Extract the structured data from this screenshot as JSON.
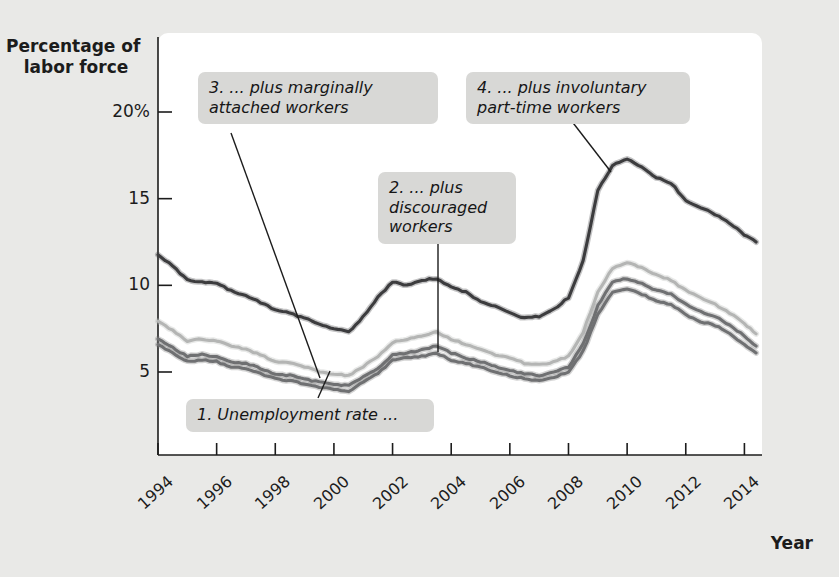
{
  "figure": {
    "background_color": "#e9e9e7",
    "plot_background_color": "#ffffff"
  },
  "axes": {
    "y_title_line1": "Percentage of",
    "y_title_line2": "labor force",
    "x_title": "Year",
    "y_ticks": [
      {
        "value": 20,
        "label": "20%"
      },
      {
        "value": 15,
        "label": "15"
      },
      {
        "value": 10,
        "label": "10"
      },
      {
        "value": 5,
        "label": "5"
      }
    ],
    "x_ticks": [
      {
        "value": 1994,
        "label": "1994"
      },
      {
        "value": 1996,
        "label": "1996"
      },
      {
        "value": 1998,
        "label": "1998"
      },
      {
        "value": 2000,
        "label": "2000"
      },
      {
        "value": 2002,
        "label": "2002"
      },
      {
        "value": 2004,
        "label": "2004"
      },
      {
        "value": 2006,
        "label": "2006"
      },
      {
        "value": 2008,
        "label": "2008"
      },
      {
        "value": 2010,
        "label": "2010"
      },
      {
        "value": 2012,
        "label": "2012"
      },
      {
        "value": 2014,
        "label": "2014"
      }
    ]
  },
  "annotations": [
    {
      "id": "callout-1",
      "text": "1. Unemployment rate ..."
    },
    {
      "id": "callout-2",
      "text": "2. ... plus\ndiscouraged\nworkers"
    },
    {
      "id": "callout-3",
      "text": "3. ... plus marginally\nattached workers"
    },
    {
      "id": "callout-4",
      "text": "4. ... plus involuntary\npart-time workers"
    }
  ],
  "chart_data": {
    "type": "line",
    "title": "",
    "xlabel": "Year",
    "ylabel": "Percentage of labor force",
    "xlim": [
      1994,
      2014.6
    ],
    "ylim": [
      0,
      21.5
    ],
    "grid": false,
    "legend": "annotations-inline",
    "colors": {
      "u3_unemployment_rate": "#6f7072",
      "u4_plus_discouraged": "#6f7072",
      "u5_plus_marginally_attached": "#b4b5b4",
      "u6_plus_involuntary_parttime": "#3c3c3e"
    },
    "x": [
      1994.0,
      1994.5,
      1995.0,
      1995.5,
      1996.0,
      1996.5,
      1997.0,
      1997.5,
      1998.0,
      1998.5,
      1999.0,
      1999.5,
      2000.0,
      2000.5,
      2001.0,
      2001.5,
      2002.0,
      2002.5,
      2003.0,
      2003.5,
      2004.0,
      2004.5,
      2005.0,
      2005.5,
      2006.0,
      2006.5,
      2007.0,
      2007.5,
      2008.0,
      2008.5,
      2009.0,
      2009.5,
      2010.0,
      2010.5,
      2011.0,
      2011.5,
      2012.0,
      2012.5,
      2013.0,
      2013.5,
      2014.0,
      2014.4
    ],
    "series": [
      {
        "name": "1. Unemployment rate (U-3)",
        "key": "u3_unemployment_rate",
        "color": "#6f7072",
        "values": [
          6.6,
          6.1,
          5.6,
          5.7,
          5.6,
          5.3,
          5.2,
          4.9,
          4.6,
          4.5,
          4.3,
          4.1,
          4.0,
          3.9,
          4.4,
          4.9,
          5.7,
          5.8,
          5.9,
          6.1,
          5.7,
          5.5,
          5.3,
          5.0,
          4.8,
          4.6,
          4.5,
          4.7,
          5.0,
          6.2,
          8.3,
          9.6,
          9.8,
          9.5,
          9.1,
          8.9,
          8.3,
          7.9,
          7.7,
          7.2,
          6.6,
          6.1
        ]
      },
      {
        "name": "2. ... plus discouraged workers (U-4)",
        "key": "u4_plus_discouraged",
        "color": "#6f7072",
        "values": [
          6.9,
          6.4,
          5.9,
          6.0,
          5.9,
          5.6,
          5.5,
          5.2,
          4.9,
          4.8,
          4.6,
          4.4,
          4.3,
          4.2,
          4.7,
          5.2,
          6.0,
          6.1,
          6.3,
          6.5,
          6.1,
          5.8,
          5.6,
          5.3,
          5.1,
          4.9,
          4.8,
          5.0,
          5.3,
          6.6,
          8.8,
          10.2,
          10.4,
          10.1,
          9.7,
          9.5,
          8.9,
          8.5,
          8.2,
          7.7,
          7.1,
          6.5
        ]
      },
      {
        "name": "3. ... plus marginally attached workers (U-5)",
        "key": "u5_plus_marginally_attached",
        "color": "#b4b5b4",
        "values": [
          7.9,
          7.4,
          6.8,
          6.9,
          6.8,
          6.5,
          6.3,
          6.0,
          5.6,
          5.5,
          5.3,
          5.0,
          4.9,
          4.8,
          5.3,
          5.9,
          6.7,
          6.9,
          7.1,
          7.3,
          6.9,
          6.6,
          6.3,
          6.0,
          5.8,
          5.5,
          5.4,
          5.6,
          5.9,
          7.3,
          9.6,
          11.0,
          11.3,
          11.0,
          10.6,
          10.3,
          9.7,
          9.3,
          8.9,
          8.4,
          7.8,
          7.2
        ]
      },
      {
        "name": "4. ... plus involuntary part-time workers (U-6)",
        "key": "u6_plus_involuntary_parttime",
        "color": "#3c3c3e",
        "values": [
          11.8,
          11.1,
          10.3,
          10.2,
          10.1,
          9.7,
          9.4,
          9.0,
          8.6,
          8.4,
          8.1,
          7.8,
          7.5,
          7.3,
          8.2,
          9.3,
          10.2,
          10.0,
          10.3,
          10.4,
          9.9,
          9.6,
          9.1,
          8.8,
          8.4,
          8.1,
          8.2,
          8.6,
          9.3,
          11.4,
          15.5,
          16.9,
          17.3,
          16.8,
          16.2,
          15.9,
          14.9,
          14.5,
          14.1,
          13.6,
          12.9,
          12.5
        ]
      }
    ]
  }
}
